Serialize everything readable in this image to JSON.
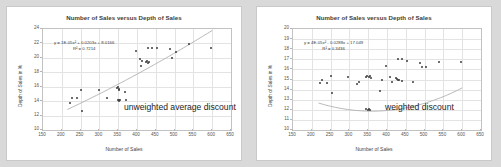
{
  "chart_data": [
    {
      "type": "scatter",
      "id": "unweighted",
      "title": "Number of Sales versus Depth of Sales",
      "xlabel": "Number of Sales",
      "ylabel": "Depth of Sales in %",
      "xlim": [
        150,
        650
      ],
      "ylim": [
        10,
        24
      ],
      "xticks": [
        150,
        200,
        250,
        300,
        350,
        400,
        450,
        500,
        550,
        600,
        650
      ],
      "yticks": [
        10,
        12,
        14,
        16,
        18,
        20,
        22,
        24
      ],
      "grid": true,
      "legend": "none",
      "annotation": "unweighted average discount",
      "equation": "y = 1E-05x² + 0.0203x + 8.0166",
      "r_squared": "R² = 0.7214",
      "trendline": {
        "type": "polynomial-2",
        "a": 1e-05,
        "b": 0.0203,
        "c": 8.0166,
        "x_start": 215,
        "x_end": 600
      },
      "points": [
        [
          222,
          13.8
        ],
        [
          228,
          14.4
        ],
        [
          240,
          14.4
        ],
        [
          251,
          15.55
        ],
        [
          253,
          12.6
        ],
        [
          298,
          15.5
        ],
        [
          320,
          14.5
        ],
        [
          347,
          15.8
        ],
        [
          349,
          15.9
        ],
        [
          351,
          15.7
        ],
        [
          352,
          15.6
        ],
        [
          349,
          14.1
        ],
        [
          352,
          14.05
        ],
        [
          355,
          14.1
        ],
        [
          351,
          14.15
        ],
        [
          368,
          15.3
        ],
        [
          370,
          14.15
        ],
        [
          398,
          20.9
        ],
        [
          409,
          19.8
        ],
        [
          412,
          19.55
        ],
        [
          410,
          18.85
        ],
        [
          424,
          19.4
        ],
        [
          427,
          19.5
        ],
        [
          430,
          19.35
        ],
        [
          433,
          19.45
        ],
        [
          428,
          21.4
        ],
        [
          441,
          21.4
        ],
        [
          452,
          21.4
        ],
        [
          489,
          21.25
        ],
        [
          492,
          20.0
        ],
        [
          503,
          20.75
        ],
        [
          538,
          21.9
        ],
        [
          598,
          21.3
        ]
      ]
    },
    {
      "type": "scatter",
      "id": "weighted",
      "title": "Number of Sales versus Depth of Sales",
      "xlabel": "Number of Sales",
      "ylabel": "Depth of Sales in %",
      "xlim": [
        150,
        650
      ],
      "ylim": [
        10,
        20
      ],
      "xticks": [
        150,
        200,
        250,
        300,
        350,
        400,
        450,
        500,
        550,
        600,
        650
      ],
      "yticks": [
        10,
        11,
        12,
        13,
        14,
        15,
        16,
        17,
        18,
        19,
        20
      ],
      "grid": true,
      "legend": "none",
      "annotation": "weighted discount",
      "equation": "y = 4E-05x² - 0.0288x + 17.049",
      "r_squared": "R² = 0.3436",
      "trendline": {
        "type": "polynomial-2",
        "a": 4e-05,
        "b": -0.0288,
        "c": 17.049,
        "x_start": 218,
        "x_end": 600
      },
      "points": [
        [
          222,
          14.65
        ],
        [
          228,
          15.0
        ],
        [
          240,
          14.7
        ],
        [
          251,
          15.3
        ],
        [
          253,
          13.65
        ],
        [
          296,
          15.2
        ],
        [
          319,
          14.6
        ],
        [
          325,
          14.75
        ],
        [
          345,
          15.2
        ],
        [
          348,
          15.35
        ],
        [
          352,
          15.25
        ],
        [
          355,
          15.3
        ],
        [
          358,
          15.1
        ],
        [
          345,
          12.05
        ],
        [
          349,
          12.0
        ],
        [
          352,
          12.05
        ],
        [
          356,
          12.0
        ],
        [
          382,
          13.9
        ],
        [
          386,
          14.95
        ],
        [
          398,
          16.35
        ],
        [
          409,
          15.2
        ],
        [
          413,
          14.75
        ],
        [
          424,
          15.1
        ],
        [
          427,
          15.05
        ],
        [
          430,
          14.95
        ],
        [
          433,
          15.0
        ],
        [
          441,
          14.85
        ],
        [
          428,
          17.0
        ],
        [
          441,
          17.0
        ],
        [
          452,
          16.85
        ],
        [
          470,
          14.75
        ],
        [
          489,
          16.6
        ],
        [
          492,
          16.2
        ],
        [
          503,
          16.25
        ],
        [
          538,
          16.75
        ],
        [
          598,
          16.7
        ]
      ]
    }
  ]
}
